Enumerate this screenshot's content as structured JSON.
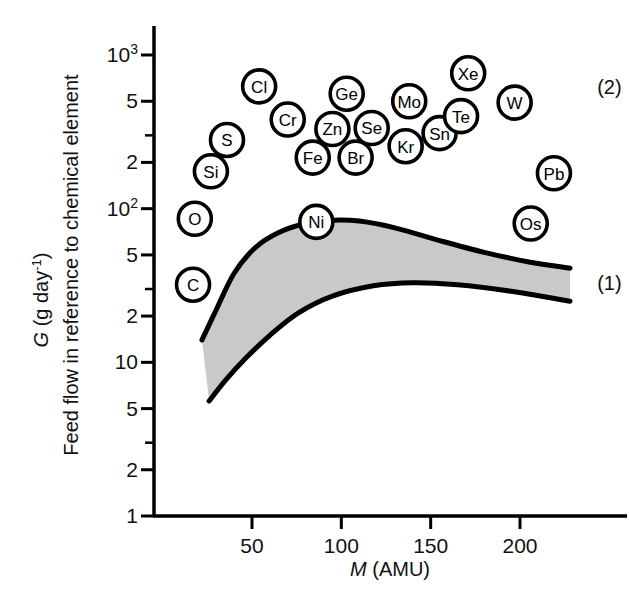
{
  "chart_data": {
    "type": "scatter",
    "title": "",
    "xlabel": "M (AMU)",
    "ylabel": "G (g day−1)",
    "ylabel_secondary": "Feed flow in reference to chemical element",
    "xlim": [
      10,
      232
    ],
    "ylim": [
      1,
      1000
    ],
    "yscale": "log",
    "xscale": "linear",
    "grid": false,
    "legend_position": "right-inline",
    "x_ticks": [
      {
        "value": 50,
        "label": "50"
      },
      {
        "value": 100,
        "label": "100"
      },
      {
        "value": 150,
        "label": "150"
      },
      {
        "value": 200,
        "label": "200"
      }
    ],
    "y_ticks": [
      {
        "value": 1000,
        "label": "10",
        "sup": "3",
        "major": true
      },
      {
        "value": 500,
        "label": "5",
        "sup": "",
        "major": true
      },
      {
        "value": 300,
        "label": "",
        "sup": "",
        "major": false
      },
      {
        "value": 200,
        "label": "2",
        "sup": "",
        "major": true
      },
      {
        "value": 100,
        "label": "10",
        "sup": "2",
        "major": true
      },
      {
        "value": 50,
        "label": "5",
        "sup": "",
        "major": true
      },
      {
        "value": 30,
        "label": "",
        "sup": "",
        "major": false
      },
      {
        "value": 20,
        "label": "2",
        "sup": "",
        "major": true
      },
      {
        "value": 10,
        "label": "10",
        "sup": "",
        "major": true
      },
      {
        "value": 5,
        "label": "5",
        "sup": "",
        "major": true
      },
      {
        "value": 3,
        "label": "",
        "sup": "",
        "major": false
      },
      {
        "value": 2,
        "label": "2",
        "sup": "",
        "major": true
      },
      {
        "value": 1,
        "label": "1",
        "sup": "",
        "major": true
      }
    ],
    "element_markers": [
      {
        "label": "C",
        "x": 17,
        "y": 32
      },
      {
        "label": "O",
        "x": 18,
        "y": 86
      },
      {
        "label": "Si",
        "x": 27,
        "y": 175
      },
      {
        "label": "S",
        "x": 36,
        "y": 280
      },
      {
        "label": "Cl",
        "x": 54,
        "y": 625
      },
      {
        "label": "Cr",
        "x": 70,
        "y": 380
      },
      {
        "label": "Fe",
        "x": 84,
        "y": 215
      },
      {
        "label": "Ni",
        "x": 86,
        "y": 82
      },
      {
        "label": "Zn",
        "x": 95,
        "y": 330
      },
      {
        "label": "Ge",
        "x": 103,
        "y": 560
      },
      {
        "label": "Br",
        "x": 108,
        "y": 215
      },
      {
        "label": "Se",
        "x": 117,
        "y": 335
      },
      {
        "label": "Kr",
        "x": 136,
        "y": 255
      },
      {
        "label": "Mo",
        "x": 138,
        "y": 500
      },
      {
        "label": "Sn",
        "x": 155,
        "y": 310
      },
      {
        "label": "Te",
        "x": 167,
        "y": 400
      },
      {
        "label": "Xe",
        "x": 171,
        "y": 760
      },
      {
        "label": "W",
        "x": 197,
        "y": 490
      },
      {
        "label": "Os",
        "x": 206,
        "y": 80
      },
      {
        "label": "Pb",
        "x": 219,
        "y": 170
      }
    ],
    "bands": [
      {
        "name": "band-1",
        "annotation": "(1)",
        "upper": [
          {
            "x": 22,
            "y": 14.0
          },
          {
            "x": 30,
            "y": 22.0
          },
          {
            "x": 40,
            "y": 38.0
          },
          {
            "x": 52,
            "y": 56.0
          },
          {
            "x": 65,
            "y": 70.0
          },
          {
            "x": 80,
            "y": 80.0
          },
          {
            "x": 95,
            "y": 84.0
          },
          {
            "x": 110,
            "y": 83.0
          },
          {
            "x": 130,
            "y": 75.0
          },
          {
            "x": 155,
            "y": 62.0
          },
          {
            "x": 180,
            "y": 52.0
          },
          {
            "x": 205,
            "y": 45.0
          },
          {
            "x": 228,
            "y": 41.0
          }
        ],
        "lower": [
          {
            "x": 26,
            "y": 5.6
          },
          {
            "x": 35,
            "y": 7.6
          },
          {
            "x": 46,
            "y": 10.5
          },
          {
            "x": 60,
            "y": 15.0
          },
          {
            "x": 76,
            "y": 21.0
          },
          {
            "x": 95,
            "y": 27.0
          },
          {
            "x": 118,
            "y": 31.5
          },
          {
            "x": 140,
            "y": 33.0
          },
          {
            "x": 165,
            "y": 32.0
          },
          {
            "x": 195,
            "y": 29.0
          },
          {
            "x": 228,
            "y": 25.0
          }
        ]
      }
    ],
    "annotations": [
      {
        "text": "(2)",
        "x": 232,
        "y": 620,
        "describes": "upper group of element markers"
      },
      {
        "text": "(1)",
        "x": 232,
        "y": 33,
        "describes": "shaded band region"
      }
    ]
  },
  "styling": {
    "axis_color": "#000000",
    "band_fill": "#c9c9c9",
    "band_edge": "#000000",
    "marker_fill": "#ffffff",
    "marker_edge": "#000000",
    "background": "#ffffff"
  }
}
